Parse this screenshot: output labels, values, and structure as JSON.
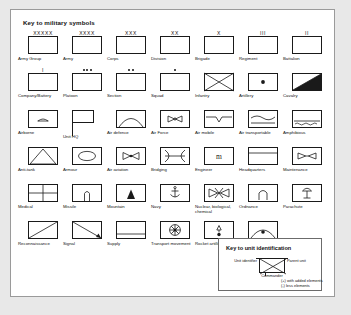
{
  "panel": {
    "title": "Key to military symbols",
    "background": "#ffffff",
    "page_background": "#e8e8e8",
    "ink": "#1a1a1a"
  },
  "symbols": [
    [
      {
        "label": "Army Group",
        "echelon": "XXXXX",
        "glyph": "plain"
      },
      {
        "label": "Army",
        "echelon": "XXXX",
        "glyph": "plain"
      },
      {
        "label": "Corps",
        "echelon": "XXX",
        "glyph": "plain"
      },
      {
        "label": "Division",
        "echelon": "XX",
        "glyph": "plain"
      },
      {
        "label": "Brigade",
        "echelon": "X",
        "glyph": "plain"
      },
      {
        "label": "Regiment",
        "echelon": "III",
        "glyph": "plain"
      },
      {
        "label": "Battalion",
        "echelon": "II",
        "glyph": "plain"
      }
    ],
    [
      {
        "label": "Company/Battery",
        "echelon": "I",
        "glyph": "plain"
      },
      {
        "label": "Platoon",
        "echelon": "",
        "dots": 3,
        "glyph": "plain"
      },
      {
        "label": "Section",
        "echelon": "",
        "dots": 2,
        "glyph": "plain"
      },
      {
        "label": "Squad",
        "echelon": "",
        "dots": 1,
        "glyph": "plain"
      },
      {
        "label": "Infantry",
        "echelon": "",
        "glyph": "infantry"
      },
      {
        "label": "Artillery",
        "echelon": "",
        "glyph": "artillery"
      },
      {
        "label": "Cavalry",
        "echelon": "",
        "glyph": "cavalry"
      }
    ],
    [
      {
        "label": "Airborne",
        "echelon": "",
        "glyph": "airborne"
      },
      {
        "label": "Unit HQ",
        "echelon": "",
        "glyph": "hq"
      },
      {
        "label": "Air defence",
        "echelon": "",
        "glyph": "airdefence"
      },
      {
        "label": "Air Force",
        "echelon": "",
        "glyph": "airforce"
      },
      {
        "label": "Air mobile",
        "echelon": "",
        "glyph": "airmobile"
      },
      {
        "label": "Air transportable",
        "echelon": "",
        "glyph": "airtransportable"
      },
      {
        "label": "Amphibious",
        "echelon": "",
        "glyph": "amphibious"
      }
    ],
    [
      {
        "label": "Anti-tank",
        "echelon": "",
        "glyph": "antitank"
      },
      {
        "label": "Armour",
        "echelon": "",
        "glyph": "armour"
      },
      {
        "label": "Air aviation",
        "echelon": "",
        "glyph": "airaviation"
      },
      {
        "label": "Bridging",
        "echelon": "",
        "glyph": "bridging"
      },
      {
        "label": "Engineer",
        "echelon": "",
        "glyph": "engineer"
      },
      {
        "label": "Headquarters",
        "echelon": "",
        "glyph": "headquarters"
      },
      {
        "label": "Maintenance",
        "echelon": "",
        "glyph": "maintenance"
      }
    ],
    [
      {
        "label": "Medical",
        "echelon": "",
        "glyph": "medical"
      },
      {
        "label": "Missile",
        "echelon": "",
        "glyph": "missile"
      },
      {
        "label": "Mountain",
        "echelon": "",
        "glyph": "mountain"
      },
      {
        "label": "Navy",
        "echelon": "",
        "glyph": "navy"
      },
      {
        "label": "Nuclear, biological, chemical",
        "echelon": "",
        "glyph": "nbc"
      },
      {
        "label": "Ordnance",
        "echelon": "",
        "glyph": "ordnance"
      },
      {
        "label": "Parachute",
        "echelon": "",
        "glyph": "parachute"
      }
    ],
    [
      {
        "label": "Reconnaissance",
        "echelon": "",
        "glyph": "recon"
      },
      {
        "label": "Signal",
        "echelon": "",
        "glyph": "signal"
      },
      {
        "label": "Supply",
        "echelon": "",
        "glyph": "supply"
      },
      {
        "label": "Transport movement",
        "echelon": "",
        "glyph": "transport"
      },
      {
        "label": "Rocket artillery",
        "echelon": "",
        "glyph": "rocketartillery"
      },
      {
        "label": "Air defence artillery",
        "echelon": "",
        "glyph": "airdefenceartillery"
      }
    ]
  ],
  "legend": {
    "title": "Key to unit identification",
    "unit_identifier": "Unit identifier",
    "parent_unit": "Parent unit",
    "commander": "Commander",
    "plus_note": "(+) with added elements",
    "minus_note": "(-) less elements"
  }
}
